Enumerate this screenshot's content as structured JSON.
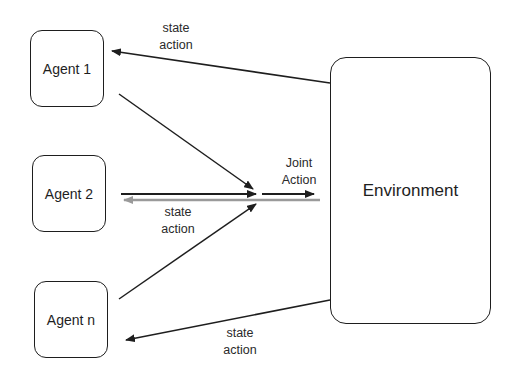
{
  "diagram": {
    "agents": [
      {
        "label": "Agent 1"
      },
      {
        "label": "Agent 2"
      },
      {
        "label": "Agent n"
      }
    ],
    "environment": {
      "label": "Environment"
    },
    "edges": {
      "top_feedback": {
        "line1": "state",
        "line2": "action"
      },
      "middle_feedback": {
        "line1": "state",
        "line2": "action"
      },
      "joint_action": {
        "line1": "Joint",
        "line2": "Action"
      },
      "bottom_feedback": {
        "line1": "state",
        "line2": "action"
      }
    },
    "colors": {
      "stroke": "#1e1e1e",
      "feedback_gray": "#9a9a9a"
    }
  }
}
